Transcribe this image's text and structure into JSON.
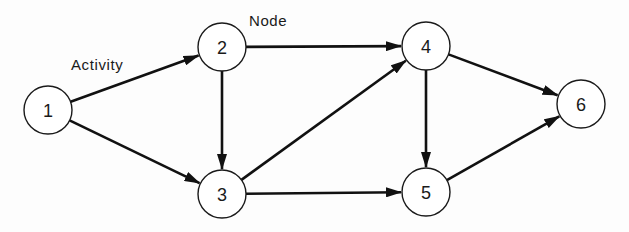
{
  "diagram": {
    "type": "network-graph",
    "colors": {
      "stroke": "#111111",
      "node_fill": "#ffffff",
      "text": "#1a1a1a"
    },
    "annotations": [
      {
        "id": "activity-label",
        "text": "Activity",
        "x": 71,
        "y": 70
      },
      {
        "id": "node-label",
        "text": "Node",
        "x": 249,
        "y": 26
      }
    ],
    "nodes": [
      {
        "id": "1",
        "label": "1",
        "cx": 48,
        "cy": 110,
        "r": 24
      },
      {
        "id": "2",
        "label": "2",
        "cx": 222,
        "cy": 47,
        "r": 24
      },
      {
        "id": "3",
        "label": "3",
        "cx": 222,
        "cy": 194,
        "r": 24
      },
      {
        "id": "4",
        "label": "4",
        "cx": 426,
        "cy": 46,
        "r": 24
      },
      {
        "id": "5",
        "label": "5",
        "cx": 426,
        "cy": 192,
        "r": 24
      },
      {
        "id": "6",
        "label": "6",
        "cx": 581,
        "cy": 104,
        "r": 24
      }
    ],
    "edges": [
      {
        "from": "1",
        "to": "2"
      },
      {
        "from": "1",
        "to": "3"
      },
      {
        "from": "2",
        "to": "3"
      },
      {
        "from": "2",
        "to": "4"
      },
      {
        "from": "3",
        "to": "4"
      },
      {
        "from": "3",
        "to": "5"
      },
      {
        "from": "4",
        "to": "5"
      },
      {
        "from": "4",
        "to": "6"
      },
      {
        "from": "5",
        "to": "6"
      }
    ]
  }
}
